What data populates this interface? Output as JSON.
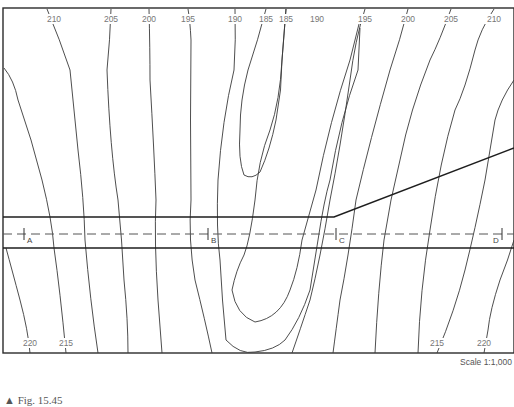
{
  "figure": {
    "caption": "▲ Fig. 15.45",
    "scale": "Scale 1:1,000"
  },
  "contour_labels_top": [
    {
      "value": "210",
      "x": 54
    },
    {
      "value": "205",
      "x": 111
    },
    {
      "value": "200",
      "x": 149
    },
    {
      "value": "195",
      "x": 188
    },
    {
      "value": "190",
      "x": 235
    },
    {
      "value": "185",
      "x": 266
    },
    {
      "value": "185",
      "x": 286
    },
    {
      "value": "190",
      "x": 317
    },
    {
      "value": "195",
      "x": 365
    },
    {
      "value": "200",
      "x": 408
    },
    {
      "value": "205",
      "x": 451
    },
    {
      "value": "210",
      "x": 494
    }
  ],
  "contour_labels_bottom": [
    {
      "value": "220",
      "x": 30
    },
    {
      "value": "215",
      "x": 66
    },
    {
      "value": "215",
      "x": 437
    },
    {
      "value": "220",
      "x": 484
    }
  ],
  "stations": [
    {
      "label": "A",
      "x": 24
    },
    {
      "label": "B",
      "x": 208
    },
    {
      "label": "C",
      "x": 336
    },
    {
      "label": "D",
      "x": 502
    }
  ],
  "road": {
    "upper_edge_y": 217,
    "centerline_y": 234,
    "lower_edge_y": 248,
    "spur_from": [
      334,
      217
    ],
    "spur_to": [
      514,
      148
    ]
  }
}
